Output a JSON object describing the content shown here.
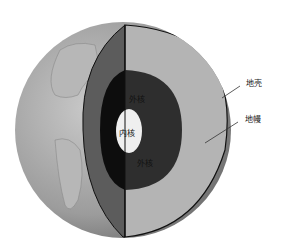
{
  "diagram": {
    "labels": {
      "crust": "地壳",
      "mantle": "地幔",
      "outer_core_top": "外核",
      "inner_core": "内核",
      "outer_core_bottom": "外核"
    },
    "colors": {
      "globe_surface": "#9a9a9a",
      "mantle_left": "#5c5c5c",
      "mantle_right": "#b4b4b4",
      "outer_core_left": "#0d0d0d",
      "outer_core_right": "#2e2e2e",
      "inner_core": "#efefef",
      "outline": "#111111"
    }
  }
}
